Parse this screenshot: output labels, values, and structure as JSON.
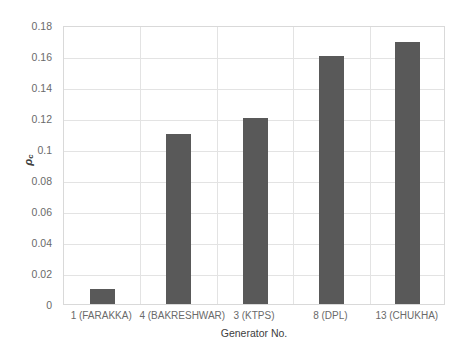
{
  "chart_data": {
    "type": "bar",
    "title": "",
    "categories": [
      "1 (FARAKKA)",
      "4 (BAKRESHWAR)",
      "3 (KTPS)",
      "8 (DPL)",
      "13 (CHUKHA)"
    ],
    "values": [
      0.01,
      0.11,
      0.12,
      0.16,
      0.169
    ],
    "series": [
      {
        "name": "",
        "values": [
          0.01,
          0.11,
          0.12,
          0.16,
          0.169
        ]
      }
    ],
    "xlabel": "Generator No.",
    "ylabel": "ρc",
    "ylabel_base": "ρ",
    "ylabel_sub": "c",
    "ylim": [
      0,
      0.18
    ],
    "ytick_values": [
      0,
      0.02,
      0.04,
      0.06,
      0.08,
      0.1,
      0.12,
      0.14,
      0.16,
      0.18
    ],
    "ytick_labels": [
      "0",
      "0.02",
      "0.04",
      "0.06",
      "0.08",
      "0.1",
      "0.12",
      "0.14",
      "0.16",
      "0.18"
    ],
    "grid": "horizontal-and-vertical",
    "legend": "none",
    "bar_color": "#595959",
    "grid_color": "#e3e3e3",
    "axis_border_color": "#d9d9d9",
    "background_color": "#ffffff",
    "tick_text_color": "#6a6a6a",
    "axis_title_color": "#404040"
  }
}
